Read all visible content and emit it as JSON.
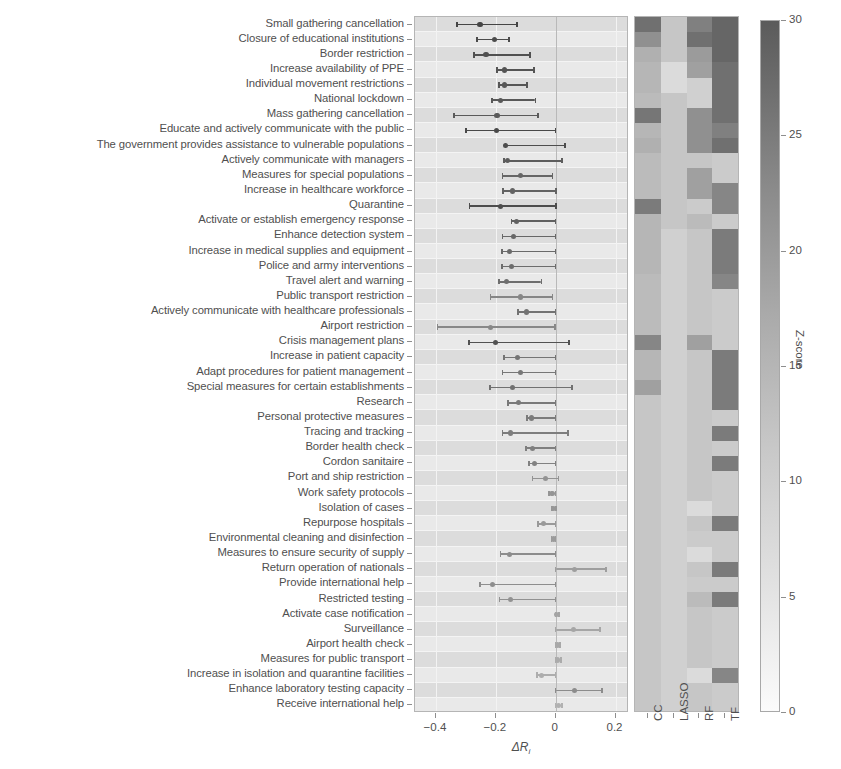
{
  "figure": {
    "xlabel": "ΔR",
    "xlabel_sub": "i",
    "colorbar_title": "Z-score"
  },
  "chart_data": {
    "type": "bar",
    "subtype": "forest-plot-with-heatmap",
    "title": "",
    "xlabel": "ΔR_i",
    "ylabel": "",
    "xlim": [
      -0.47,
      0.245
    ],
    "xticks": [
      -0.4,
      -0.2,
      0,
      0.2
    ],
    "xticklabels": [
      "−0.4",
      "−0.2",
      "0",
      "0.2"
    ],
    "grid": true,
    "legend": "none",
    "heatmap_columns": [
      "CC",
      "LASSO",
      "RF",
      "TF"
    ],
    "colorbar": {
      "title": "Z-score",
      "min": 0,
      "max": 30,
      "ticks": [
        0,
        5,
        10,
        15,
        20,
        25,
        30
      ],
      "ticklabels": [
        "0",
        "5",
        "10",
        "15",
        "20",
        "25",
        "30"
      ],
      "low_color": "#fbfbfb",
      "high_color": "#5b5b5b"
    },
    "categories": [
      "Small gathering cancellation",
      "Closure of educational institutions",
      "Border restriction",
      "Increase availability of PPE",
      "Individual movement restrictions",
      "National lockdown",
      "Mass gathering cancellation",
      "Educate and actively communicate with the public",
      "The government provides assistance to vulnerable populations",
      "Actively communicate with managers",
      "Measures for special populations",
      "Increase in healthcare workforce",
      "Quarantine",
      "Activate or establish emergency response",
      "Enhance detection system",
      "Increase in medical supplies and equipment",
      "Police and army interventions",
      "Travel alert and warning",
      "Public transport restriction",
      "Actively communicate with healthcare professionals",
      "Airport restriction",
      "Crisis management plans",
      "Increase in patient capacity",
      "Adapt procedures for patient management",
      "Special measures for certain establishments",
      "Research",
      "Personal protective measures",
      "Tracing and tracking",
      "Border health check",
      "Cordon sanitaire",
      "Port and ship restriction",
      "Work safety protocols",
      "Isolation of cases",
      "Repurpose hospitals",
      "Environmental cleaning and disinfection",
      "Measures to ensure security of supply",
      "Return operation of nationals",
      "Provide international help",
      "Restricted testing",
      "Activate case notification",
      "Surveillance",
      "Airport health check",
      "Measures for public transport",
      "Increase in isolation and quarantine facilities",
      "Enhance laboratory testing capacity",
      "Receive international help"
    ],
    "series": [
      {
        "name": "ΔR_i effect estimate",
        "units": "change in R_i",
        "points": [
          {
            "category": "Small gathering cancellation",
            "estimate": -0.253,
            "ci_low": -0.33,
            "ci_high": -0.13,
            "zscore": 28.0
          },
          {
            "category": "Closure of educational institutions",
            "estimate": -0.205,
            "ci_low": -0.262,
            "ci_high": -0.155,
            "zscore": 26.5
          },
          {
            "category": "Border restriction",
            "estimate": -0.233,
            "ci_low": -0.272,
            "ci_high": -0.085,
            "zscore": 25.5
          },
          {
            "category": "Increase availability of PPE",
            "estimate": -0.172,
            "ci_low": -0.196,
            "ci_high": -0.072,
            "zscore": 24.5
          },
          {
            "category": "Individual movement restrictions",
            "estimate": -0.17,
            "ci_low": -0.19,
            "ci_high": -0.095,
            "zscore": 24.0
          },
          {
            "category": "National lockdown",
            "estimate": -0.185,
            "ci_low": -0.213,
            "ci_high": -0.068,
            "zscore": 23.5
          },
          {
            "category": "Mass gathering cancellation",
            "estimate": -0.196,
            "ci_low": -0.34,
            "ci_high": -0.06,
            "zscore": 23.0
          },
          {
            "category": "Educate and actively communicate with the public",
            "estimate": -0.198,
            "ci_low": -0.3,
            "ci_high": 0.0,
            "zscore": 27.0
          },
          {
            "category": "The government provides assistance to vulnerable populations",
            "estimate": -0.167,
            "ci_low": -0.168,
            "ci_high": 0.032,
            "zscore": 26.0
          },
          {
            "category": "Actively communicate with managers",
            "estimate": -0.162,
            "ci_low": -0.172,
            "ci_high": 0.021,
            "zscore": 22.5
          },
          {
            "category": "Measures for special populations",
            "estimate": -0.118,
            "ci_low": -0.178,
            "ci_high": -0.01,
            "zscore": 20.5
          },
          {
            "category": "Increase in healthcare workforce",
            "estimate": -0.145,
            "ci_low": -0.176,
            "ci_high": 0.002,
            "zscore": 21.0
          },
          {
            "category": "Quarantine",
            "estimate": -0.185,
            "ci_low": -0.288,
            "ci_high": 0.001,
            "zscore": 26.0
          },
          {
            "category": "Activate or establish emergency response",
            "estimate": -0.132,
            "ci_low": -0.148,
            "ci_high": 0.0,
            "zscore": 21.5
          },
          {
            "category": "Enhance detection system",
            "estimate": -0.14,
            "ci_low": -0.178,
            "ci_high": 0.0,
            "zscore": 20.0
          },
          {
            "category": "Increase in medical supplies and equipment",
            "estimate": -0.155,
            "ci_low": -0.18,
            "ci_high": 0.0,
            "zscore": 19.5
          },
          {
            "category": "Police and army interventions",
            "estimate": -0.148,
            "ci_low": -0.18,
            "ci_high": 0.0,
            "zscore": 19.0
          },
          {
            "category": "Travel alert and warning",
            "estimate": -0.163,
            "ci_low": -0.19,
            "ci_high": -0.048,
            "zscore": 18.5
          },
          {
            "category": "Public transport restriction",
            "estimate": -0.118,
            "ci_low": -0.218,
            "ci_high": -0.01,
            "zscore": 13.0
          },
          {
            "category": "Actively communicate with healthcare professionals",
            "estimate": -0.098,
            "ci_low": -0.125,
            "ci_high": 0.0,
            "zscore": 17.5
          },
          {
            "category": "Airport restriction",
            "estimate": -0.218,
            "ci_low": -0.395,
            "ci_high": -0.002,
            "zscore": 12.5
          },
          {
            "category": "Crisis management plans",
            "estimate": -0.2,
            "ci_low": -0.29,
            "ci_high": 0.045,
            "zscore": 25.0
          },
          {
            "category": "Increase in patient capacity",
            "estimate": -0.128,
            "ci_low": -0.172,
            "ci_high": 0.0,
            "zscore": 17.0
          },
          {
            "category": "Adapt procedures for patient management",
            "estimate": -0.118,
            "ci_low": -0.178,
            "ci_high": 0.0,
            "zscore": 16.5
          },
          {
            "category": "Special measures for certain establishments",
            "estimate": -0.145,
            "ci_low": -0.22,
            "ci_high": 0.055,
            "zscore": 18.0
          },
          {
            "category": "Research",
            "estimate": -0.125,
            "ci_low": -0.16,
            "ci_high": 0.0,
            "zscore": 16.0
          },
          {
            "category": "Personal protective measures",
            "estimate": -0.082,
            "ci_low": -0.096,
            "ci_high": 0.0,
            "zscore": 15.5
          },
          {
            "category": "Tracing and tracking",
            "estimate": -0.15,
            "ci_low": -0.178,
            "ci_high": 0.042,
            "zscore": 15.0
          },
          {
            "category": "Border health check",
            "estimate": -0.078,
            "ci_low": -0.1,
            "ci_high": 0.0,
            "zscore": 14.5
          },
          {
            "category": "Cordon sanitaire",
            "estimate": -0.07,
            "ci_low": -0.09,
            "ci_high": 0.0,
            "zscore": 14.0
          },
          {
            "category": "Port and ship restriction",
            "estimate": -0.035,
            "ci_low": -0.078,
            "ci_high": 0.01,
            "zscore": 10.0
          },
          {
            "category": "Work safety protocols",
            "estimate": -0.012,
            "ci_low": -0.022,
            "ci_high": 0.0,
            "zscore": 9.5
          },
          {
            "category": "Isolation of cases",
            "estimate": -0.006,
            "ci_low": -0.012,
            "ci_high": 0.002,
            "zscore": 9.0
          },
          {
            "category": "Repurpose hospitals",
            "estimate": -0.042,
            "ci_low": -0.06,
            "ci_high": 0.0,
            "zscore": 8.5
          },
          {
            "category": "Environmental cleaning and disinfection",
            "estimate": -0.008,
            "ci_low": -0.014,
            "ci_high": 0.0,
            "zscore": 8.0
          },
          {
            "category": "Measures to ensure security of supply",
            "estimate": -0.153,
            "ci_low": -0.185,
            "ci_high": 0.0,
            "zscore": 11.5
          },
          {
            "category": "Return operation of nationals",
            "estimate": 0.062,
            "ci_low": 0.0,
            "ci_high": 0.168,
            "zscore": 7.5
          },
          {
            "category": "Provide international help",
            "estimate": -0.212,
            "ci_low": -0.253,
            "ci_high": 0.0,
            "zscore": 11.0
          },
          {
            "category": "Restricted testing",
            "estimate": -0.152,
            "ci_low": -0.188,
            "ci_high": 0.0,
            "zscore": 10.5
          },
          {
            "category": "Activate case notification",
            "estimate": 0.004,
            "ci_low": 0.0,
            "ci_high": 0.012,
            "zscore": 6.0
          },
          {
            "category": "Surveillance",
            "estimate": 0.06,
            "ci_low": 0.0,
            "ci_high": 0.148,
            "zscore": 5.5
          },
          {
            "category": "Airport health check",
            "estimate": 0.005,
            "ci_low": 0.0,
            "ci_high": 0.015,
            "zscore": 5.0
          },
          {
            "category": "Measures for public transport",
            "estimate": 0.006,
            "ci_low": 0.0,
            "ci_high": 0.018,
            "zscore": 4.5
          },
          {
            "category": "Increase in isolation and quarantine facilities",
            "estimate": -0.048,
            "ci_low": -0.062,
            "ci_high": 0.0,
            "zscore": 4.0
          },
          {
            "category": "Enhance laboratory testing capacity",
            "estimate": 0.064,
            "ci_low": 0.0,
            "ci_high": 0.155,
            "zscore": 11.5
          },
          {
            "category": "Receive international help",
            "estimate": 0.01,
            "ci_low": 0.0,
            "ci_high": 0.022,
            "zscore": 3.0
          }
        ]
      }
    ],
    "heatmap": {
      "columns": [
        "CC",
        "LASSO",
        "RF",
        "TF"
      ],
      "value_range": [
        0,
        30
      ],
      "rows": [
        {
          "category": "Small gathering cancellation",
          "CC": 26,
          "LASSO": 10,
          "RF": 23,
          "TF": 28
        },
        {
          "category": "Closure of educational institutions",
          "CC": 20,
          "LASSO": 10,
          "RF": 26,
          "TF": 28
        },
        {
          "category": "Border restriction",
          "CC": 14,
          "LASSO": 10,
          "RF": 18,
          "TF": 28
        },
        {
          "category": "Increase availability of PPE",
          "CC": 13,
          "LASSO": 6,
          "RF": 17,
          "TF": 26
        },
        {
          "category": "Individual movement restrictions",
          "CC": 13,
          "LASSO": 6,
          "RF": 8,
          "TF": 26
        },
        {
          "category": "National lockdown",
          "CC": 12,
          "LASSO": 10,
          "RF": 8,
          "TF": 26
        },
        {
          "category": "Mass gathering cancellation",
          "CC": 25,
          "LASSO": 10,
          "RF": 20,
          "TF": 26
        },
        {
          "category": "Educate and actively communicate with the public",
          "CC": 13,
          "LASSO": 10,
          "RF": 20,
          "TF": 23
        },
        {
          "category": "The government provides assistance to vulnerable populations",
          "CC": 14,
          "LASSO": 10,
          "RF": 20,
          "TF": 26
        },
        {
          "category": "Actively communicate with managers",
          "CC": 12,
          "LASSO": 10,
          "RF": 10,
          "TF": 9
        },
        {
          "category": "Measures for special populations",
          "CC": 12,
          "LASSO": 10,
          "RF": 17,
          "TF": 9
        },
        {
          "category": "Increase in healthcare workforce",
          "CC": 12,
          "LASSO": 10,
          "RF": 17,
          "TF": 22
        },
        {
          "category": "Quarantine",
          "CC": 24,
          "LASSO": 10,
          "RF": 9,
          "TF": 22
        },
        {
          "category": "Activate or establish emergency response",
          "CC": 13,
          "LASSO": 10,
          "RF": 12,
          "TF": 9
        },
        {
          "category": "Enhance detection system",
          "CC": 13,
          "LASSO": 8,
          "RF": 10,
          "TF": 24
        },
        {
          "category": "Increase in medical supplies and equipment",
          "CC": 13,
          "LASSO": 8,
          "RF": 10,
          "TF": 24
        },
        {
          "category": "Police and army interventions",
          "CC": 13,
          "LASSO": 8,
          "RF": 10,
          "TF": 24
        },
        {
          "category": "Travel alert and warning",
          "CC": 12,
          "LASSO": 8,
          "RF": 10,
          "TF": 22
        },
        {
          "category": "Public transport restriction",
          "CC": 12,
          "LASSO": 8,
          "RF": 10,
          "TF": 9
        },
        {
          "category": "Actively communicate with healthcare professionals",
          "CC": 12,
          "LASSO": 8,
          "RF": 10,
          "TF": 9
        },
        {
          "category": "Airport restriction",
          "CC": 12,
          "LASSO": 8,
          "RF": 10,
          "TF": 9
        },
        {
          "category": "Crisis management plans",
          "CC": 22,
          "LASSO": 8,
          "RF": 17,
          "TF": 9
        },
        {
          "category": "Increase in patient capacity",
          "CC": 13,
          "LASSO": 8,
          "RF": 10,
          "TF": 24
        },
        {
          "category": "Adapt procedures for patient management",
          "CC": 13,
          "LASSO": 8,
          "RF": 10,
          "TF": 24
        },
        {
          "category": "Special measures for certain establishments",
          "CC": 17,
          "LASSO": 8,
          "RF": 10,
          "TF": 24
        },
        {
          "category": "Research",
          "CC": 10,
          "LASSO": 8,
          "RF": 10,
          "TF": 24
        },
        {
          "category": "Personal protective measures",
          "CC": 10,
          "LASSO": 8,
          "RF": 10,
          "TF": 9
        },
        {
          "category": "Tracing and tracking",
          "CC": 10,
          "LASSO": 8,
          "RF": 10,
          "TF": 24
        },
        {
          "category": "Border health check",
          "CC": 10,
          "LASSO": 8,
          "RF": 10,
          "TF": 9
        },
        {
          "category": "Cordon sanitaire",
          "CC": 10,
          "LASSO": 8,
          "RF": 10,
          "TF": 24
        },
        {
          "category": "Port and ship restriction",
          "CC": 10,
          "LASSO": 8,
          "RF": 10,
          "TF": 9
        },
        {
          "category": "Work safety protocols",
          "CC": 10,
          "LASSO": 8,
          "RF": 10,
          "TF": 9
        },
        {
          "category": "Isolation of cases",
          "CC": 10,
          "LASSO": 8,
          "RF": 6,
          "TF": 9
        },
        {
          "category": "Repurpose hospitals",
          "CC": 10,
          "LASSO": 8,
          "RF": 10,
          "TF": 24
        },
        {
          "category": "Environmental cleaning and disinfection",
          "CC": 10,
          "LASSO": 8,
          "RF": 9,
          "TF": 9
        },
        {
          "category": "Measures to ensure security of supply",
          "CC": 10,
          "LASSO": 8,
          "RF": 6,
          "TF": 9
        },
        {
          "category": "Return operation of nationals",
          "CC": 10,
          "LASSO": 8,
          "RF": 10,
          "TF": 24
        },
        {
          "category": "Provide international help",
          "CC": 10,
          "LASSO": 8,
          "RF": 9,
          "TF": 9
        },
        {
          "category": "Restricted testing",
          "CC": 10,
          "LASSO": 8,
          "RF": 12,
          "TF": 24
        },
        {
          "category": "Activate case notification",
          "CC": 10,
          "LASSO": 8,
          "RF": 10,
          "TF": 9
        },
        {
          "category": "Surveillance",
          "CC": 10,
          "LASSO": 8,
          "RF": 10,
          "TF": 9
        },
        {
          "category": "Airport health check",
          "CC": 10,
          "LASSO": 8,
          "RF": 10,
          "TF": 9
        },
        {
          "category": "Measures for public transport",
          "CC": 10,
          "LASSO": 8,
          "RF": 10,
          "TF": 9
        },
        {
          "category": "Increase in isolation and quarantine facilities",
          "CC": 10,
          "LASSO": 8,
          "RF": 6,
          "TF": 22
        },
        {
          "category": "Enhance laboratory testing capacity",
          "CC": 10,
          "LASSO": 8,
          "RF": 10,
          "TF": 9
        },
        {
          "category": "Receive international help",
          "CC": 10,
          "LASSO": 8,
          "RF": 10,
          "TF": 9
        }
      ]
    }
  }
}
